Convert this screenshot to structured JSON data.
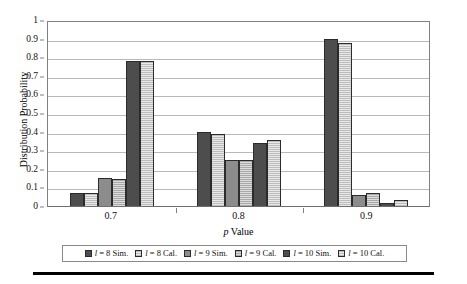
{
  "chart_data": {
    "type": "bar",
    "title": "",
    "subtitle": "",
    "xlabel": "p Value",
    "xlabel_italic_prefix": "p",
    "xlabel_rest": " Value",
    "ylabel": "Distribution Probability",
    "categories": [
      "0.7",
      "0.8",
      "0.9"
    ],
    "ylim": [
      0,
      1
    ],
    "ytick_labels": [
      "0",
      "0.1",
      "0.2",
      "0.3",
      "0.4",
      "0.5",
      "0.6",
      "0.7",
      "0.8",
      "0.9",
      "1"
    ],
    "ytick_values": [
      0,
      0.1,
      0.2,
      0.3,
      0.4,
      0.5,
      0.6,
      0.7,
      0.8,
      0.9,
      1
    ],
    "grid": true,
    "grid_axis": "y",
    "legend_position": "bottom",
    "series": [
      {
        "name": "l = 8 Sim.",
        "label_italic": "l",
        "label_rest": " = 8 Sim.",
        "style": "fill-dark",
        "values": [
          0.07,
          0.4,
          0.9
        ]
      },
      {
        "name": "l = 8 Cal.",
        "label_italic": "l",
        "label_rest": " = 8 Cal.",
        "style": "fill-hatch",
        "values": [
          0.07,
          0.385,
          0.875
        ]
      },
      {
        "name": "l = 9 Sim.",
        "label_italic": "l",
        "label_rest": " = 9 Sim.",
        "style": "fill-mid",
        "values": [
          0.15,
          0.245,
          0.06
        ]
      },
      {
        "name": "l = 9 Cal.",
        "label_italic": "l",
        "label_rest": " = 9 Cal.",
        "style": "fill-hatch-mid",
        "values": [
          0.145,
          0.25,
          0.07
        ]
      },
      {
        "name": "l = 10 Sim.",
        "label_italic": "l",
        "label_rest": " = 10 Sim.",
        "style": "fill-dark",
        "values": [
          0.78,
          0.34,
          0.015
        ]
      },
      {
        "name": "l = 10 Cal.",
        "label_italic": "l",
        "label_rest": " = 10 Cal.",
        "style": "fill-hatch",
        "values": [
          0.78,
          0.355,
          0.03
        ]
      }
    ]
  }
}
